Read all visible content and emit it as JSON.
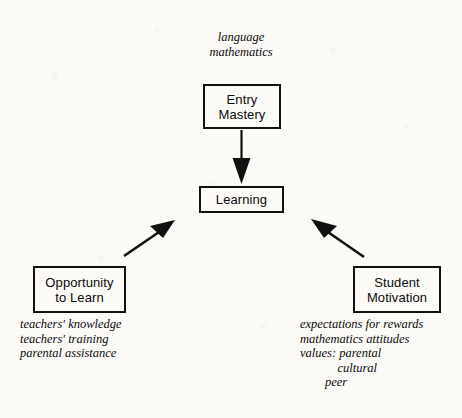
{
  "diagram": {
    "background_color": "#fbfaf7",
    "ink_color": "#101010",
    "top_annotation": {
      "lines": [
        "language",
        "mathematics"
      ]
    },
    "nodes": {
      "entry_mastery": {
        "lines": [
          "Entry",
          "Mastery"
        ]
      },
      "learning": {
        "lines": [
          "Learning"
        ]
      },
      "opportunity_to_learn": {
        "lines": [
          "Opportunity",
          "to Learn"
        ]
      },
      "student_motivation": {
        "lines": [
          "Student",
          "Motivation"
        ]
      }
    },
    "left_annotation": {
      "lines": [
        "teachers' knowledge",
        "teachers' training",
        "parental assistance"
      ]
    },
    "right_annotation": {
      "lines": [
        "expectations for rewards",
        "mathematics attitudes",
        "values: parental",
        "            cultural",
        "        peer"
      ]
    },
    "arrows": [
      {
        "name": "entry-mastery-to-learning",
        "from": "Entry Mastery",
        "to": "Learning",
        "direction": "down"
      },
      {
        "name": "opportunity-to-learning",
        "from": "Opportunity to Learn",
        "to": "Learning",
        "direction": "up-right"
      },
      {
        "name": "motivation-to-learning",
        "from": "Student Motivation",
        "to": "Learning",
        "direction": "up-left"
      }
    ]
  }
}
